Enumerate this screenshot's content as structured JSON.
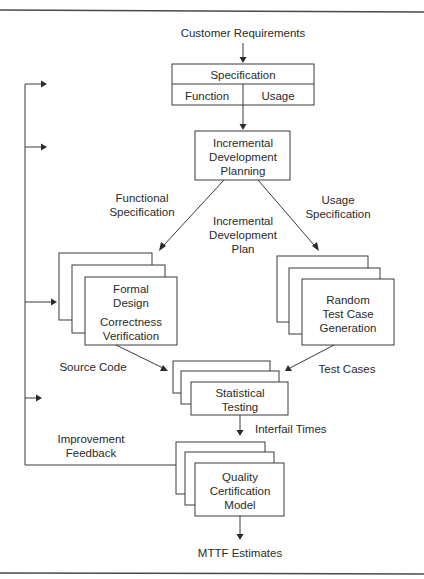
{
  "diagram": {
    "input_label": "Customer Requirements",
    "specification": {
      "title": "Specification",
      "left_cell": "Function",
      "right_cell": "Usage"
    },
    "planning": {
      "lines": [
        "Incremental",
        "Development",
        "Planning"
      ]
    },
    "edge_labels": {
      "functional_spec": [
        "Functional",
        "Specification"
      ],
      "usage_spec": [
        "Usage",
        "Specification"
      ],
      "increment_plan": [
        "Incremental",
        "Development",
        "Plan"
      ],
      "source_code": "Source Code",
      "test_cases": "Test Cases",
      "interfail_times": "Interfail Times",
      "improvement_feedback": [
        "Improvement",
        "Feedback"
      ],
      "output": "MTTF Estimates"
    },
    "formal_design": {
      "lines": [
        "Formal",
        "Design"
      ],
      "sub_lines": [
        "Correctness",
        "Verification"
      ]
    },
    "test_generation": {
      "lines": [
        "Random",
        "Test Case",
        "Generation"
      ]
    },
    "statistical_testing": {
      "lines": [
        "Statistical",
        "Testing"
      ]
    },
    "certification": {
      "lines": [
        "Quality",
        "Certification",
        "Model"
      ]
    }
  }
}
